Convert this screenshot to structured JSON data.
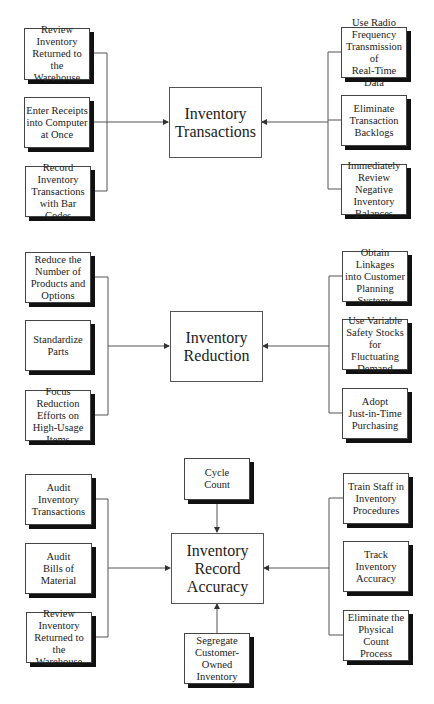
{
  "diagram": {
    "sections": [
      {
        "center": {
          "label": "Inventory\nTransactions"
        },
        "left": [
          {
            "label": "Review\nInventory\nReturned to the\nWarehouse"
          },
          {
            "label": "Enter Receipts\ninto Computer\nat Once"
          },
          {
            "label": "Record\nInventory\nTransactions\nwith Bar Codes"
          }
        ],
        "right": [
          {
            "label": "Use Radio\nFrequency\nTransmission of\nReal-Time Data"
          },
          {
            "label": "Eliminate\nTransaction\nBacklogs"
          },
          {
            "label": "Immediately\nReview Negative\nInventory\nBalances"
          }
        ]
      },
      {
        "center": {
          "label": "Inventory\nReduction"
        },
        "left": [
          {
            "label": "Reduce the\nNumber of\nProducts and\nOptions"
          },
          {
            "label": "Standardize\nParts"
          },
          {
            "label": "Focus Reduction\nEfforts on\nHigh-Usage\nItems"
          }
        ],
        "right": [
          {
            "label": "Obtain Linkages\ninto Customer\nPlanning\nSystems"
          },
          {
            "label": "Use Variable\nSafety Stocks\nfor Fluctuating\nDemand"
          },
          {
            "label": "Adopt\nJust-in-Time\nPurchasing"
          }
        ]
      },
      {
        "center": {
          "label": "Inventory\nRecord\nAccuracy"
        },
        "top": {
          "label": "Cycle\nCount"
        },
        "bottom": {
          "label": "Segregate\nCustomer-\nOwned\nInventory"
        },
        "left": [
          {
            "label": "Audit\nInventory\nTransactions"
          },
          {
            "label": "Audit\nBills of\nMaterial"
          },
          {
            "label": "Review\nInventory\nReturned to the\nWarehouse"
          }
        ],
        "right": [
          {
            "label": "Train Staff in\nInventory\nProcedures"
          },
          {
            "label": "Track\nInventory\nAccuracy"
          },
          {
            "label": "Eliminate the\nPhysical Count\nProcess"
          }
        ]
      }
    ]
  }
}
